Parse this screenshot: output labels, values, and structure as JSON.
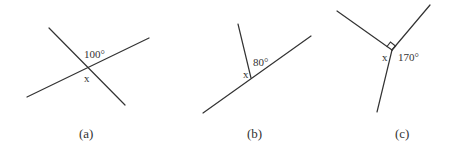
{
  "figures": [
    {
      "id": "a",
      "caption": "(a)",
      "angle_given": "100°",
      "angle_unknown": "x",
      "lines": [
        {
          "x1": 49,
          "y1": 28,
          "x2": 125,
          "y2": 105
        },
        {
          "x1": 27,
          "y1": 97,
          "x2": 149,
          "y2": 38
        }
      ],
      "given_pos": {
        "x": 84,
        "y": 58
      },
      "unknown_pos": {
        "x": 84,
        "y": 82
      },
      "caption_pos": {
        "x": 79,
        "y": 138
      }
    },
    {
      "id": "b",
      "caption": "(b)",
      "angle_given": "80°",
      "angle_unknown": "x",
      "lines": [
        {
          "x1": 238,
          "y1": 24,
          "x2": 251,
          "y2": 78
        },
        {
          "x1": 203,
          "y1": 113,
          "x2": 311,
          "y2": 36
        }
      ],
      "given_pos": {
        "x": 253,
        "y": 66
      },
      "unknown_pos": {
        "x": 243,
        "y": 78
      },
      "caption_pos": {
        "x": 247,
        "y": 138
      }
    },
    {
      "id": "c",
      "caption": "(c)",
      "angle_given": "170°",
      "angle_unknown": "x",
      "right_angle_marker": true,
      "lines": [
        {
          "x1": 337,
          "y1": 11,
          "x2": 392,
          "y2": 50
        },
        {
          "x1": 392,
          "y1": 50,
          "x2": 430,
          "y2": 5
        },
        {
          "x1": 392,
          "y1": 50,
          "x2": 377,
          "y2": 112
        }
      ],
      "given_pos": {
        "x": 398,
        "y": 61
      },
      "unknown_pos": {
        "x": 382,
        "y": 61
      },
      "caption_pos": {
        "x": 395,
        "y": 138
      }
    }
  ]
}
